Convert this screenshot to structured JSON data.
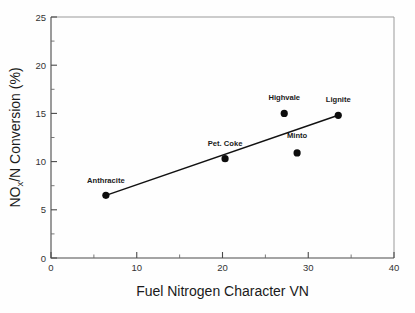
{
  "chart_data": {
    "type": "scatter",
    "title": "",
    "subtitle": "",
    "xlabel": "Fuel Nitrogen Character VN",
    "ylabel_main": "NO",
    "ylabel_sub": "x",
    "ylabel_rest": "/N Conversion (%)",
    "ylabel_full": "NOx/N Conversion (%)",
    "xlim": [
      0,
      40
    ],
    "ylim": [
      0,
      25
    ],
    "x_ticks": [
      0,
      10,
      20,
      30,
      40
    ],
    "x_tick_labels": [
      "0",
      "10",
      "20",
      "30",
      "40"
    ],
    "x_minor_ticks": [
      5,
      15,
      25,
      35
    ],
    "y_ticks": [
      0,
      5,
      10,
      15,
      20,
      25
    ],
    "y_tick_labels": [
      "0",
      "5",
      "10",
      "15",
      "20",
      "25"
    ],
    "y_minor_ticks": [
      2.5,
      7.5,
      12.5,
      17.5,
      22.5
    ],
    "grid": false,
    "legend": "none",
    "marker_color": "#0d0d0d",
    "line_color": "#111111",
    "points": [
      {
        "label": "Anthracite",
        "x": 6.4,
        "y": 6.5,
        "label_dx": 0,
        "label_dy": -12
      },
      {
        "label": "Pet. Coke",
        "x": 20.3,
        "y": 10.3,
        "label_dx": 0,
        "label_dy": -13
      },
      {
        "label": "Highvale",
        "x": 27.2,
        "y": 15.0,
        "label_dx": 0,
        "label_dy": -13
      },
      {
        "label": "Minto",
        "x": 28.7,
        "y": 10.9,
        "label_dx": 0,
        "label_dy": -15
      },
      {
        "label": "Lignite",
        "x": 33.5,
        "y": 14.8,
        "label_dx": 0,
        "label_dy": -13
      }
    ],
    "trend_line": {
      "name": "linear fit",
      "x_start": 6.4,
      "y_start": 6.5,
      "x_end": 33.5,
      "y_end": 14.8
    }
  }
}
